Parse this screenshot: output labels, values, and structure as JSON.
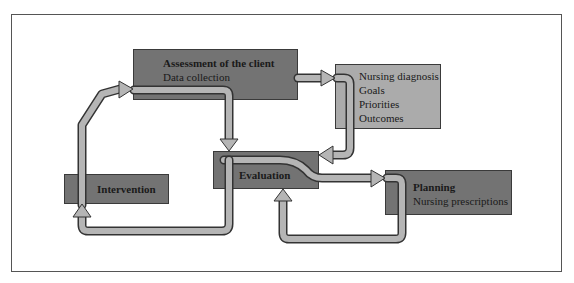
{
  "diagram": {
    "nodes": {
      "assessment": {
        "title": "Assessment of the client",
        "subtitle": "Data collection"
      },
      "diagnosis": {
        "lines": [
          "Nursing diagnosis",
          "Goals",
          "Priorities",
          "Outcomes"
        ]
      },
      "evaluation": {
        "title": "Evaluation"
      },
      "intervention": {
        "title": "Intervention"
      },
      "planning": {
        "title": "Planning",
        "subtitle": "Nursing prescriptions"
      }
    },
    "edges": [
      {
        "from": "intervention",
        "to": "assessment"
      },
      {
        "from": "assessment",
        "to": "diagnosis"
      },
      {
        "from": "assessment",
        "to": "evaluation"
      },
      {
        "from": "diagnosis",
        "to": "evaluation"
      },
      {
        "from": "evaluation",
        "to": "planning"
      },
      {
        "from": "planning",
        "to": "evaluation"
      },
      {
        "from": "evaluation",
        "to": "intervention"
      }
    ],
    "colors": {
      "dark_box": "#737373",
      "light_box": "#ababab",
      "arrow": "#b5b5b5",
      "arrow_outline": "#333333"
    }
  }
}
